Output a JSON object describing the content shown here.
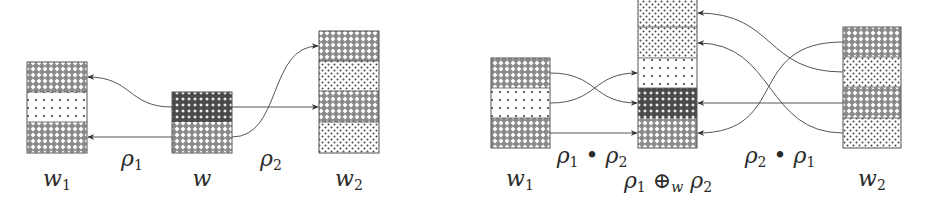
{
  "colors": {
    "stroke": "#555555",
    "ink": "#2a2a2a",
    "background": "#ffffff"
  },
  "patterns": {
    "crosshatch": "light crosshatch (white diamonds on dark mesh)",
    "crosshatch_dark": "dense dark crosshatch",
    "dots_sparse": "sparse dot grid",
    "dots_dense": "dense staggered dots"
  },
  "left_diagram": {
    "boxes": [
      {
        "id": "w1",
        "label_base": "w",
        "label_sub": "1",
        "x": 27,
        "y": 62,
        "w": 60,
        "segments": [
          {
            "pattern": "crosshatch",
            "h": 30
          },
          {
            "pattern": "dots_sparse",
            "h": 30
          },
          {
            "pattern": "crosshatch",
            "h": 31
          }
        ]
      },
      {
        "id": "w",
        "label_base": "w",
        "label_sub": "",
        "x": 172,
        "y": 92,
        "w": 60,
        "segments": [
          {
            "pattern": "crosshatch_dark",
            "h": 30
          },
          {
            "pattern": "crosshatch",
            "h": 31
          }
        ]
      },
      {
        "id": "w2",
        "label_base": "w",
        "label_sub": "2",
        "x": 319,
        "y": 31,
        "w": 60,
        "segments": [
          {
            "pattern": "crosshatch",
            "h": 30
          },
          {
            "pattern": "dots_dense",
            "h": 30
          },
          {
            "pattern": "crosshatch",
            "h": 31
          },
          {
            "pattern": "dots_dense",
            "h": 31
          }
        ]
      }
    ],
    "edge_labels": [
      {
        "id": "rho1",
        "base": "ρ",
        "sub": "1",
        "x": 132,
        "y": 150
      },
      {
        "id": "rho2",
        "base": "ρ",
        "sub": "2",
        "x": 272,
        "y": 150
      }
    ],
    "box_labels": [
      {
        "for": "w1",
        "base": "w",
        "sub": "1",
        "x": 57,
        "y": 170
      },
      {
        "for": "w",
        "base": "w",
        "sub": "",
        "x": 202,
        "y": 170
      },
      {
        "for": "w2",
        "base": "w",
        "sub": "2",
        "x": 349,
        "y": 170
      }
    ],
    "arrows": [
      {
        "from": "w.top",
        "to": "w1.seg1",
        "d": "M172,107 C130,107 130,77 88,77"
      },
      {
        "from": "w.bottom",
        "to": "w1.seg3",
        "d": "M172,137 L88,137"
      },
      {
        "from": "w.top",
        "to": "w2.seg3",
        "d": "M232,107 L318,107"
      },
      {
        "from": "w.bottom",
        "to": "w2.seg1",
        "d": "M232,137 C280,137 270,46 318,46"
      }
    ]
  },
  "right_diagram": {
    "boxes": [
      {
        "id": "w1",
        "x": 491,
        "y": 58,
        "w": 59,
        "segments": [
          {
            "pattern": "crosshatch",
            "h": 30
          },
          {
            "pattern": "dots_sparse",
            "h": 30
          },
          {
            "pattern": "crosshatch",
            "h": 30
          }
        ]
      },
      {
        "id": "merge",
        "x": 638,
        "y": -3,
        "w": 59,
        "segments": [
          {
            "pattern": "dots_dense",
            "h": 30
          },
          {
            "pattern": "dots_dense",
            "h": 31
          },
          {
            "pattern": "dots_sparse",
            "h": 30
          },
          {
            "pattern": "crosshatch_dark",
            "h": 30
          },
          {
            "pattern": "crosshatch",
            "h": 30
          }
        ]
      },
      {
        "id": "w2",
        "x": 843,
        "y": 27,
        "w": 58,
        "segments": [
          {
            "pattern": "crosshatch",
            "h": 30
          },
          {
            "pattern": "dots_dense",
            "h": 30
          },
          {
            "pattern": "crosshatch",
            "h": 31
          },
          {
            "pattern": "dots_dense",
            "h": 30
          }
        ]
      }
    ],
    "edge_labels": [
      {
        "id": "rho1-bullet-rho2",
        "text": "ρ₁ • ρ₂",
        "x": 590,
        "y": 145
      },
      {
        "id": "rho2-bullet-rho1",
        "text": "ρ₂ • ρ₁",
        "x": 780,
        "y": 145
      }
    ],
    "box_labels": [
      {
        "for": "w1",
        "text": "w₁",
        "x": 520,
        "y": 170
      },
      {
        "for": "merge",
        "text": "ρ₁ ⊕w ρ₂",
        "x": 668,
        "y": 172
      },
      {
        "for": "w2",
        "text": "w₂",
        "x": 872,
        "y": 170
      }
    ],
    "arrows": [
      {
        "from": "w1.seg1",
        "to": "merge.seg4",
        "d": "M550,73 C595,73 595,103 637,103"
      },
      {
        "from": "w1.seg2",
        "to": "merge.seg3",
        "d": "M550,103 C595,103 595,73 637,73"
      },
      {
        "from": "w1.seg3",
        "to": "merge.seg5",
        "d": "M550,133 L637,133"
      },
      {
        "from": "w2.seg1",
        "to": "merge.seg5",
        "d": "M843,42 C740,42 770,133 698,133"
      },
      {
        "from": "w2.seg2",
        "to": "merge.seg1",
        "d": "M843,72 C760,72 760,13 698,13"
      },
      {
        "from": "w2.seg3",
        "to": "merge.seg4",
        "d": "M843,103 L698,103"
      },
      {
        "from": "w2.seg4",
        "to": "merge.seg2",
        "d": "M843,133 C760,133 760,43 698,43"
      }
    ]
  },
  "labels": {
    "left_w1": "w",
    "left_w1_sub": "1",
    "left_w": "w",
    "left_w2": "w",
    "left_w2_sub": "2",
    "left_rho1": "ρ",
    "left_rho1_sub": "1",
    "left_rho2": "ρ",
    "left_rho2_sub": "2",
    "right_w1": "w",
    "right_w1_sub": "1",
    "right_w2": "w",
    "right_w2_sub": "2",
    "right_comp12_a": "ρ",
    "right_comp12_a_sub": "1",
    "right_comp12_op": " • ",
    "right_comp12_b": "ρ",
    "right_comp12_b_sub": "2",
    "right_comp21_a": "ρ",
    "right_comp21_a_sub": "2",
    "right_comp21_op": " • ",
    "right_comp21_b": "ρ",
    "right_comp21_b_sub": "1",
    "right_merge_a": "ρ",
    "right_merge_a_sub": "1",
    "right_merge_op": " ⊕",
    "right_merge_op_sub": "w",
    "right_merge_b": " ρ",
    "right_merge_b_sub": "2"
  }
}
